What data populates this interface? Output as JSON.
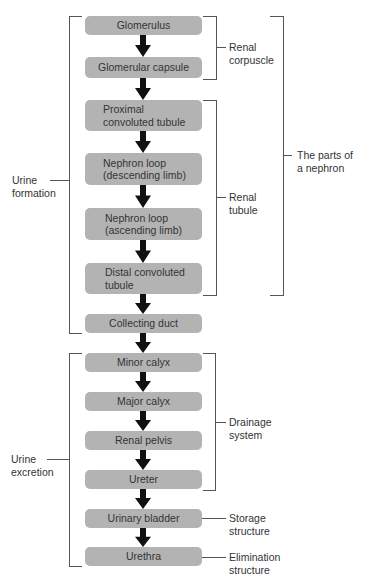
{
  "diagram": {
    "steps": [
      {
        "label": "Glomerulus"
      },
      {
        "label": "Glomerular capsule"
      },
      {
        "label": "Proximal convoluted tubule",
        "line1": "Proximal",
        "line2": "convoluted tubule"
      },
      {
        "label": "Nephron loop (descending limb)",
        "line1": "Nephron loop",
        "line2": "(descending limb)"
      },
      {
        "label": "Nephron loop (ascending limb)",
        "line1": "Nephron loop",
        "line2": "(ascending limb)"
      },
      {
        "label": "Distal convoluted tubule",
        "line1": "Distal convoluted",
        "line2": "tubule"
      },
      {
        "label": "Collecting duct"
      },
      {
        "label": "Minor calyx"
      },
      {
        "label": "Major calyx"
      },
      {
        "label": "Renal pelvis"
      },
      {
        "label": "Ureter"
      },
      {
        "label": "Urinary bladder"
      },
      {
        "label": "Urethra"
      }
    ],
    "groups": {
      "urine_formation": {
        "line1": "Urine",
        "line2": "formation",
        "spans": [
          "Glomerulus",
          "Collecting duct"
        ]
      },
      "urine_excretion": {
        "line1": "Urine",
        "line2": "excretion",
        "spans": [
          "Minor calyx",
          "Urethra"
        ]
      },
      "renal_corpuscle": {
        "line1": "Renal",
        "line2": "corpuscle",
        "spans": [
          "Glomerulus",
          "Glomerular capsule"
        ]
      },
      "renal_tubule": {
        "line1": "Renal",
        "line2": "tubule",
        "spans": [
          "Proximal convoluted tubule",
          "Distal convoluted tubule"
        ]
      },
      "parts_of_nephron": {
        "line1": "The parts of",
        "line2": "a nephron",
        "spans": [
          "Glomerulus",
          "Distal convoluted tubule"
        ]
      },
      "drainage_system": {
        "line1": "Drainage",
        "line2": "system",
        "spans": [
          "Minor calyx",
          "Ureter"
        ]
      },
      "storage_structure": {
        "line1": "Storage",
        "line2": "structure",
        "spans": [
          "Urinary bladder"
        ]
      },
      "elimination_structure": {
        "line1": "Elimination",
        "line2": "structure",
        "spans": [
          "Urethra"
        ]
      }
    },
    "colors": {
      "box": "#b3b3b3",
      "arrow": "#111111",
      "bracket": "#555555",
      "text": "#333333"
    }
  }
}
